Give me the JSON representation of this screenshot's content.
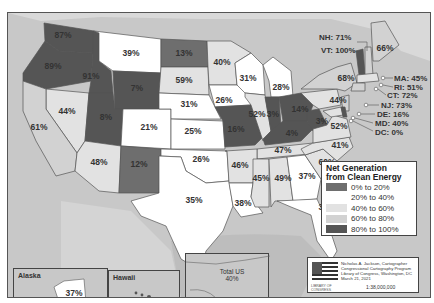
{
  "map": {
    "title": "Net Generation from Clean Energy",
    "type": "choropleth",
    "region": "United States"
  },
  "legend": {
    "title_line1": "Net Generation",
    "title_line2": "from Clean Energy",
    "classes": [
      {
        "label": "0% to 20%",
        "color": "#6e6e6e"
      },
      {
        "label": "20% to 40%",
        "color": "#ffffff"
      },
      {
        "label": "40% to 60%",
        "color": "#e2e2e2"
      },
      {
        "label": "60% to 80%",
        "color": "#d2d2d2"
      },
      {
        "label": "80% to 100%",
        "color": "#555555"
      }
    ]
  },
  "states": {
    "WA": "87%",
    "OR": "89%",
    "ID": "91%",
    "MT": "39%",
    "ND": "13%",
    "MN": "40%",
    "WI": "31%",
    "MI": "28%",
    "SD": "59%",
    "WY": "7%",
    "NE": "31%",
    "IA": "26%",
    "NV": "44%",
    "CA": "61%",
    "UT": "8%",
    "CO": "21%",
    "KS": "25%",
    "MO": "16%",
    "IL": "52%",
    "IN": "3%",
    "OH": "14%",
    "WV": "3%",
    "KY": "4%",
    "PA": "44%",
    "NY": "68%",
    "ME": "66%",
    "VA": "52%",
    "NC": "41%",
    "TN": "47%",
    "SC": "60%",
    "AZ": "48%",
    "NM": "12%",
    "OK": "26%",
    "AR": "46%",
    "MS": "45%",
    "AL": "49%",
    "GA": "37%",
    "TX": "35%",
    "LA": "38%",
    "FL": "38%"
  },
  "callouts": {
    "NH": "NH: 71%",
    "VT": "VT: 100%",
    "MA": "MA: 45%",
    "RI": "RI: 51%",
    "CT": "CT: 72%",
    "NJ": "NJ: 73%",
    "DE": "DE: 16%",
    "MD": "MD: 40%",
    "DC": "DC: 0%"
  },
  "insets": {
    "alaska": {
      "name": "Alaska",
      "value": "37%"
    },
    "hawaii": {
      "name": "Hawaii",
      "value": "78%"
    },
    "total": {
      "name": "Total US",
      "value": "40%"
    }
  },
  "credit": {
    "line1": "Nicholas A. Jackson, Cartographer",
    "line2": "Congressional Cartography Program",
    "line3": "Library of Congress, Washington, DC",
    "line4": "March 21, 2021",
    "scale": "1:38,000,000",
    "logo_text": "LIBRARY OF CONGRESS"
  }
}
